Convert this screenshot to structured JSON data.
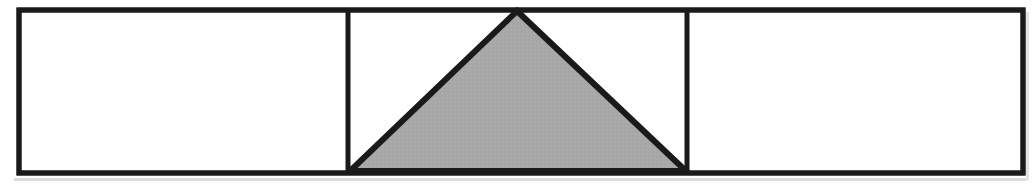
{
  "figure": {
    "title": "Rectangle divided into three sections with a shaded triangle",
    "background_color": "#fefefe",
    "stroke_color": "#1a1a1a",
    "shaded_fill_color": "#a8a8a8",
    "unshaded_fill_color": "#ffffff",
    "canvas": {
      "width": 1036,
      "height": 186
    },
    "outer_rectangle": {
      "label": "outer rectangle",
      "x": 19,
      "y": 10,
      "width": 1004,
      "height": 163,
      "stroke_width": 5,
      "fill": "#ffffff"
    },
    "dividers": [
      {
        "label": "left divider",
        "x": 348,
        "y1": 10,
        "y2": 173,
        "stroke_width": 5
      },
      {
        "label": "right divider",
        "x": 687,
        "y1": 10,
        "y2": 173,
        "stroke_width": 5
      }
    ],
    "sections": [
      {
        "label": "left section",
        "x": 19,
        "width": 329,
        "shaded": "no"
      },
      {
        "label": "middle section",
        "x": 348,
        "width": 339,
        "shaded": "partial"
      },
      {
        "label": "right section",
        "x": 687,
        "width": 336,
        "shaded": "no"
      }
    ],
    "triangle": {
      "label": "shaded triangle",
      "apex": {
        "x": 517,
        "y": 11
      },
      "bottom_left": {
        "x": 350,
        "y": 171
      },
      "bottom_right": {
        "x": 686,
        "y": 171
      },
      "points": "517,11 686,171 350,171",
      "fill": "#a8a8a8",
      "stroke_width": 6
    },
    "shadow": {
      "label": "bottom edge shadow",
      "color": "#d8d8d8"
    }
  }
}
